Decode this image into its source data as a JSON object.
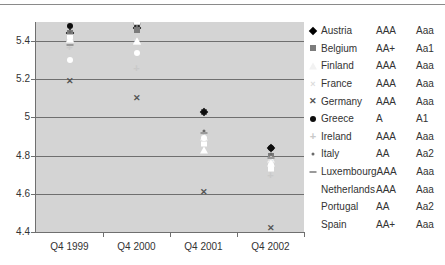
{
  "chart_data": {
    "type": "scatter",
    "title": "",
    "xlabel": "",
    "ylabel": "",
    "categories": [
      "Q4 1999",
      "Q4 2000",
      "Q4 2001",
      "Q4 2002"
    ],
    "ylim": [
      4.4,
      5.5
    ],
    "yticks": [
      "5.4",
      "5.2",
      "5",
      "4.8",
      "4.6",
      "4.4"
    ],
    "ytick_values": [
      5.4,
      5.2,
      5.0,
      4.8,
      4.6,
      4.4
    ],
    "grid": true,
    "legend_position": "right",
    "series": [
      {
        "name": "Austria",
        "marker": "diamond",
        "color": "#000000",
        "sp_rating": "AAA",
        "moody_rating": "Aaa",
        "values": [
          5.44,
          5.47,
          5.03,
          4.84
        ]
      },
      {
        "name": "Belgium",
        "marker": "square",
        "color": "#7c7c7c",
        "sp_rating": "AA+",
        "moody_rating": "Aa1",
        "values": [
          5.44,
          5.46,
          5.03,
          4.8
        ]
      },
      {
        "name": "Finland",
        "marker": "triangle",
        "color": "#f2f2f2",
        "sp_rating": "AAA",
        "moody_rating": "Aaa",
        "values": [
          5.41,
          5.4,
          4.9,
          4.78
        ]
      },
      {
        "name": "France",
        "marker": "x-light",
        "color": "#dcdcdc",
        "sp_rating": "AAA",
        "moody_rating": "Aaa",
        "values": [
          5.4,
          5.4,
          4.9,
          4.78
        ]
      },
      {
        "name": "Germany",
        "marker": "x-bold",
        "color": "#555555",
        "sp_rating": "AAA",
        "moody_rating": "Aaa",
        "values": [
          5.19,
          5.1,
          4.61,
          4.42
        ]
      },
      {
        "name": "Greece",
        "marker": "circle",
        "color": "#0d0d0d",
        "sp_rating": "A",
        "moody_rating": "A1",
        "values": [
          5.48,
          5.49,
          5.03,
          4.84
        ]
      },
      {
        "name": "Ireland",
        "marker": "plus",
        "color": "#c9c9c9",
        "sp_rating": "AAA",
        "moody_rating": "Aaa",
        "values": [
          5.37,
          5.26,
          4.92,
          4.7
        ]
      },
      {
        "name": "Italy",
        "marker": "dot",
        "color": "#6b6b6b",
        "sp_rating": "AA",
        "moody_rating": "Aa2",
        "values": [
          5.45,
          5.48,
          4.93,
          4.81
        ]
      },
      {
        "name": "Luxembourg",
        "marker": "dash",
        "color": "#9a9a9a",
        "sp_rating": "AAA",
        "moody_rating": "Aaa",
        "values": [
          5.38,
          5.49,
          4.92,
          4.79
        ]
      },
      {
        "name": "Netherlands",
        "marker": "triangle-open",
        "color": "#ffffff",
        "sp_rating": "AAA",
        "moody_rating": "Aaa",
        "values": [
          5.41,
          5.4,
          4.83,
          4.76
        ]
      },
      {
        "name": "Portugal",
        "marker": "bar",
        "color": "#ffffff",
        "sp_rating": "AA",
        "moody_rating": "Aa2",
        "values": [
          5.42,
          5.5,
          4.86,
          4.73
        ]
      },
      {
        "name": "Spain",
        "marker": "ring",
        "color": "#ffffff",
        "sp_rating": "AA+",
        "moody_rating": "Aaa",
        "values": [
          5.3,
          5.34,
          4.89,
          4.75
        ]
      }
    ]
  }
}
